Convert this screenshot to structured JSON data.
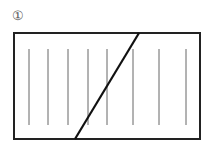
{
  "figure": {
    "label": "①",
    "rectangle": {
      "x": 14,
      "y": 33,
      "width": 186,
      "height": 106,
      "stroke": "#222222"
    },
    "vertical_lines": {
      "x_positions": [
        29,
        48,
        68,
        88,
        107,
        133,
        159,
        186
      ],
      "y_top": 49,
      "y_bottom": 125,
      "stroke": "#666666"
    },
    "diagonal": {
      "x1": 139,
      "y1": 33,
      "x2": 75,
      "y2": 139,
      "stroke": "#111111"
    }
  }
}
